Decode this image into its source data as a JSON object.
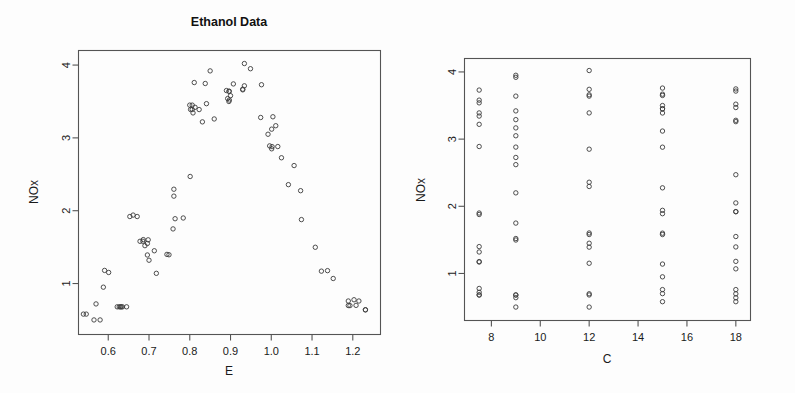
{
  "figure": {
    "background": "#fdfdfd",
    "foreground": "#1a1a1a",
    "point_color": "#3b3b3b",
    "axis_color": "#545454",
    "width": 795,
    "height": 393
  },
  "panels": {
    "left": {
      "title": "Ethanol Data",
      "xlabel": "E",
      "ylabel": "NOx",
      "xticks": [
        "0.6",
        "0.7",
        "0.8",
        "0.9",
        "1.0",
        "1.1",
        "1.2"
      ],
      "yticks": [
        "1",
        "2",
        "3",
        "4"
      ]
    },
    "right": {
      "title": "",
      "xlabel": "C",
      "ylabel": "NOx",
      "xticks": [
        "8",
        "10",
        "12",
        "14",
        "16",
        "18"
      ],
      "yticks": [
        "1",
        "2",
        "3",
        "4"
      ]
    }
  },
  "chart_data": [
    {
      "type": "scatter",
      "panel": "left",
      "title": "Ethanol Data",
      "xlabel": "E",
      "ylabel": "NOx",
      "xlim": [
        0.527,
        1.268
      ],
      "ylim": [
        0.3,
        4.2
      ],
      "xticks": [
        0.6,
        0.7,
        0.8,
        0.9,
        1.0,
        1.1,
        1.2
      ],
      "yticks": [
        1,
        2,
        3,
        4
      ],
      "grid": false,
      "legend": "none",
      "marker": "open-circle",
      "n_points": 88,
      "x": [
        0.907,
        0.761,
        1.108,
        1.016,
        1.189,
        1.001,
        1.231,
        1.123,
        1.042,
        1.215,
        0.93,
        1.152,
        1.138,
        0.601,
        0.696,
        0.686,
        1.072,
        1.074,
        0.934,
        0.808,
        1.056,
        1.025,
        0.749,
        0.823,
        0.718,
        1.231,
        1.011,
        1.004,
        1.203,
        1.189,
        1.193,
        1.208,
        0.802,
        0.811,
        0.838,
        0.85,
        0.893,
        0.934,
        0.896,
        0.897,
        0.992,
        0.996,
        1.001,
        1.002,
        0.974,
        0.976,
        0.949,
        0.93,
        0.806,
        0.86,
        0.9,
        0.897,
        0.896,
        0.89,
        0.841,
        0.831,
        0.813,
        0.806,
        0.8,
        0.801,
        0.784,
        0.761,
        0.713,
        0.698,
        0.696,
        0.7,
        0.69,
        0.685,
        0.678,
        0.671,
        0.635,
        0.627,
        0.622,
        0.588,
        0.591,
        0.57,
        0.58,
        0.565,
        0.539,
        0.546,
        0.63,
        0.632,
        0.645,
        0.661,
        0.653,
        0.744,
        0.759,
        0.764
      ],
      "y": [
        3.741,
        2.295,
        1.498,
        2.881,
        0.76,
        3.12,
        0.638,
        1.17,
        2.358,
        0.76,
        3.669,
        1.069,
        1.177,
        1.152,
        1.392,
        1.603,
        2.275,
        1.878,
        3.715,
        3.343,
        2.62,
        2.727,
        1.395,
        3.389,
        1.14,
        0.64,
        3.167,
        3.29,
        0.777,
        0.698,
        0.697,
        0.7,
        3.39,
        3.76,
        3.747,
        3.92,
        3.54,
        4.021,
        3.5,
        3.52,
        3.05,
        2.89,
        2.85,
        2.88,
        3.28,
        3.73,
        3.95,
        3.66,
        3.45,
        3.26,
        3.58,
        3.64,
        3.64,
        3.65,
        3.47,
        3.22,
        3.42,
        3.39,
        3.45,
        2.47,
        1.9,
        2.2,
        1.45,
        1.6,
        1.55,
        1.32,
        1.52,
        1.58,
        1.58,
        1.92,
        0.68,
        0.68,
        0.68,
        0.95,
        1.18,
        0.72,
        0.5,
        0.5,
        0.58,
        0.58,
        0.68,
        0.68,
        0.68,
        1.94,
        1.92,
        1.4,
        1.75,
        1.89
      ]
    },
    {
      "type": "scatter",
      "panel": "right",
      "title": "",
      "xlabel": "C",
      "ylabel": "NOx",
      "xlim": [
        6.9,
        18.6
      ],
      "ylim": [
        0.3,
        4.2
      ],
      "xticks": [
        8,
        10,
        12,
        14,
        16,
        18
      ],
      "yticks": [
        1,
        2,
        3,
        4
      ],
      "grid": false,
      "legend": "none",
      "marker": "open-circle",
      "n_points": 88,
      "categories": [
        7.5,
        9.0,
        12.0,
        15.0,
        18.0
      ],
      "x": [
        12,
        12,
        9,
        9,
        15,
        15,
        18,
        7.5,
        12,
        18,
        15,
        18,
        7.5,
        12,
        12,
        12,
        15,
        7.5,
        18,
        7.5,
        9,
        9,
        18,
        15,
        15,
        9,
        9,
        9,
        7.5,
        12,
        18,
        15,
        7.5,
        15,
        18,
        9,
        7.5,
        12,
        15,
        18,
        9,
        7.5,
        12,
        15,
        18,
        7.5,
        9,
        12,
        15,
        18,
        7.5,
        9,
        12,
        15,
        18,
        7.5,
        9,
        12,
        15,
        18,
        7.5,
        9,
        12,
        15,
        18,
        7.5,
        9,
        12,
        15,
        18,
        7.5,
        9,
        12,
        15,
        18,
        7.5,
        9,
        12,
        15,
        18,
        7.5,
        9,
        15,
        18,
        7.5,
        9,
        15,
        18
      ],
      "y": [
        3.741,
        2.295,
        1.498,
        2.881,
        0.76,
        3.12,
        0.638,
        1.17,
        2.358,
        0.76,
        3.669,
        1.069,
        1.177,
        1.152,
        1.392,
        1.603,
        2.275,
        1.878,
        3.715,
        3.343,
        2.62,
        2.727,
        1.395,
        3.389,
        1.14,
        0.64,
        3.167,
        3.29,
        0.777,
        0.698,
        0.697,
        0.7,
        3.39,
        3.76,
        3.747,
        3.92,
        3.54,
        4.021,
        3.5,
        3.52,
        3.05,
        2.89,
        2.85,
        2.88,
        3.28,
        3.73,
        3.95,
        3.66,
        3.45,
        3.26,
        3.58,
        3.64,
        3.64,
        3.65,
        3.47,
        3.22,
        3.42,
        3.39,
        3.45,
        2.47,
        1.9,
        2.2,
        1.45,
        1.6,
        1.55,
        1.32,
        1.52,
        1.58,
        1.58,
        1.92,
        0.68,
        0.68,
        0.68,
        0.95,
        1.18,
        0.72,
        0.5,
        0.5,
        0.58,
        0.58,
        0.68,
        0.68,
        1.94,
        1.92,
        1.4,
        1.75,
        1.89,
        2.05
      ]
    }
  ]
}
